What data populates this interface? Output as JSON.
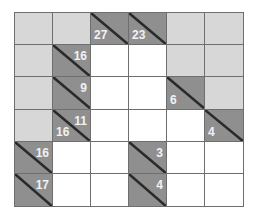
{
  "puzzle": {
    "type": "kakuro",
    "rows": 6,
    "cols": 6,
    "colors": {
      "blank": "#d7d7d7",
      "clue": "#8f8f8f",
      "white": "#ffffff",
      "line": "#6e6e6e",
      "clue_text": "#f2f2f2"
    },
    "cells": [
      [
        {
          "t": "blank"
        },
        {
          "t": "blank"
        },
        {
          "t": "clue",
          "down": "27",
          "across": ""
        },
        {
          "t": "clue",
          "down": "23",
          "across": ""
        },
        {
          "t": "blank"
        },
        {
          "t": "blank"
        }
      ],
      [
        {
          "t": "blank"
        },
        {
          "t": "clue",
          "down": "",
          "across": "16"
        },
        {
          "t": "white"
        },
        {
          "t": "white"
        },
        {
          "t": "blank"
        },
        {
          "t": "blank"
        }
      ],
      [
        {
          "t": "blank"
        },
        {
          "t": "clue",
          "down": "",
          "across": "9"
        },
        {
          "t": "white"
        },
        {
          "t": "white"
        },
        {
          "t": "clue",
          "down": "6",
          "across": ""
        },
        {
          "t": "blank"
        }
      ],
      [
        {
          "t": "blank"
        },
        {
          "t": "clue",
          "down": "16",
          "across": "11"
        },
        {
          "t": "white"
        },
        {
          "t": "white"
        },
        {
          "t": "white"
        },
        {
          "t": "clue",
          "down": "4",
          "across": ""
        }
      ],
      [
        {
          "t": "clue",
          "down": "",
          "across": "16"
        },
        {
          "t": "white"
        },
        {
          "t": "white"
        },
        {
          "t": "clue",
          "down": "",
          "across": "3"
        },
        {
          "t": "white"
        },
        {
          "t": "white"
        }
      ],
      [
        {
          "t": "clue",
          "down": "",
          "across": "17"
        },
        {
          "t": "white"
        },
        {
          "t": "white"
        },
        {
          "t": "clue",
          "down": "",
          "across": "4"
        },
        {
          "t": "white"
        },
        {
          "t": "white"
        }
      ]
    ]
  }
}
